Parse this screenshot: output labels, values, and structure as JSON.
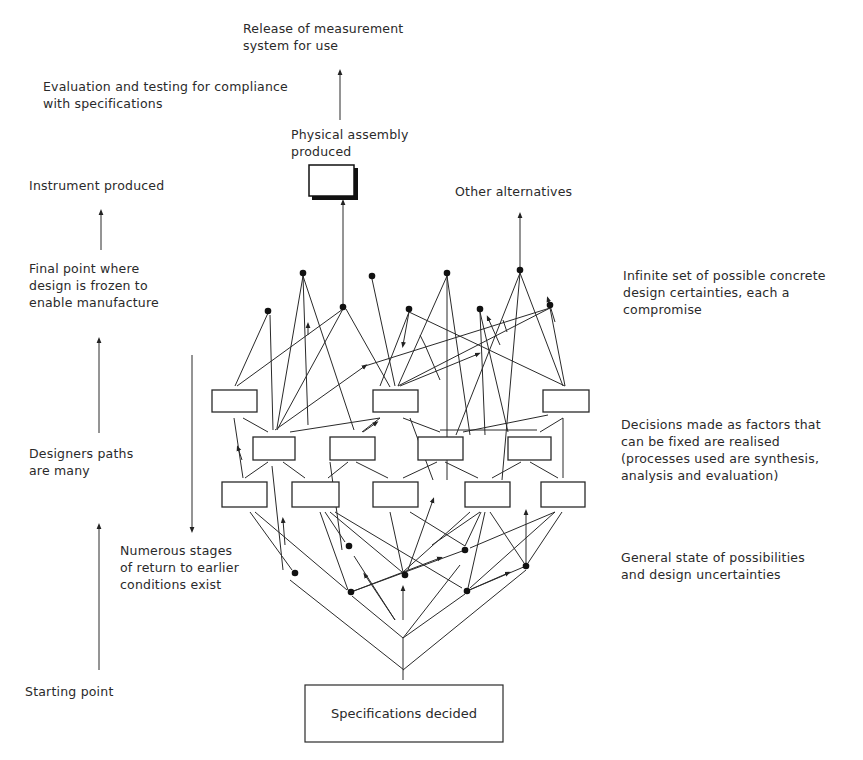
{
  "diagram": {
    "type": "design process network",
    "left_labels": {
      "evaluation": [
        "Evaluation and testing for compliance",
        "with specifications"
      ],
      "instrument": [
        "Instrument produced"
      ],
      "final_point": [
        "Final point where",
        "design is frozen to",
        "enable manufacture"
      ],
      "designers_paths": [
        "Designers paths",
        "are many"
      ],
      "starting_point": [
        "Starting point"
      ],
      "numerous_stages": [
        "Numerous stages",
        "of return to earlier",
        "conditions exist"
      ]
    },
    "top_labels": {
      "release": [
        "Release of measurement",
        "system for use"
      ],
      "physical_assembly": [
        "Physical assembly",
        "produced"
      ],
      "other_alternatives": [
        "Other alternatives"
      ]
    },
    "right_labels": {
      "infinite_set": [
        "Infinite set of possible concrete",
        "design certainties, each a",
        "compromise"
      ],
      "decisions": [
        "Decisions made as factors that",
        "can be fixed are realised",
        "(processes used are synthesis,",
        "analysis and evaluation)"
      ],
      "general_state": [
        "General state of possibilities",
        "and design uncertainties"
      ]
    },
    "bottom_box": {
      "label": "Specifications decided"
    },
    "colors": {
      "ink": "#222222",
      "background": "#ffffff"
    }
  }
}
